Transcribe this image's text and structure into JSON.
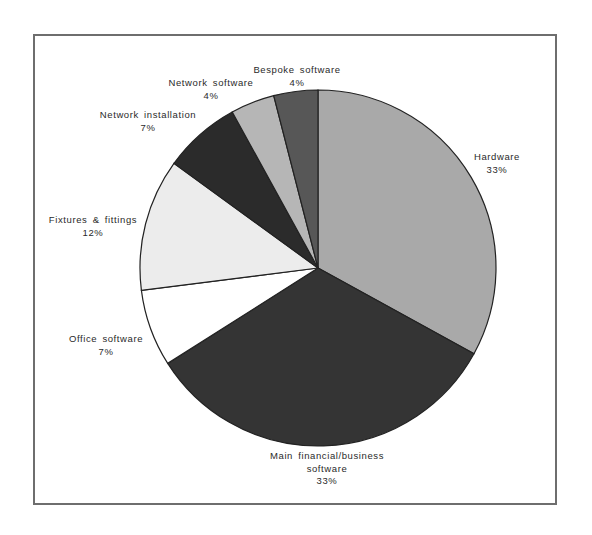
{
  "chart_data": {
    "type": "pie",
    "title": "",
    "start_angle_deg": 0,
    "direction": "clockwise",
    "slices": [
      {
        "label": "Hardware",
        "value": 33,
        "display": "33%",
        "color": "#a9a9a9"
      },
      {
        "label": "Main financial/business software",
        "value": 33,
        "display": "33%",
        "color": "#343434"
      },
      {
        "label": "Office software",
        "value": 7,
        "display": "7%",
        "color": "#ffffff"
      },
      {
        "label": "Fixtures & fittings",
        "value": 12,
        "display": "12%",
        "color": "#ececec"
      },
      {
        "label": "Network installation",
        "value": 7,
        "display": "7%",
        "color": "#2b2b2b"
      },
      {
        "label": "Network software",
        "value": 4,
        "display": "4%",
        "color": "#b6b6b6"
      },
      {
        "label": "Bespoke software",
        "value": 4,
        "display": "4%",
        "color": "#575757"
      }
    ],
    "legend": "none (direct labels)"
  },
  "labels": {
    "hardware": {
      "line1": "Hardware",
      "pct": "33%"
    },
    "main": {
      "line1": "Main financial/business",
      "line2": "software",
      "pct": "33%"
    },
    "office": {
      "line1": "Office  software",
      "pct": "7%"
    },
    "fixtures": {
      "line1": "Fixtures  &  fittings",
      "pct": "12%"
    },
    "netinst": {
      "line1": "Network  installation",
      "pct": "7%"
    },
    "netsoft": {
      "line1": "Network  software",
      "pct": "4%"
    },
    "bespoke": {
      "line1": "Bespoke  software",
      "pct": "4%"
    }
  }
}
